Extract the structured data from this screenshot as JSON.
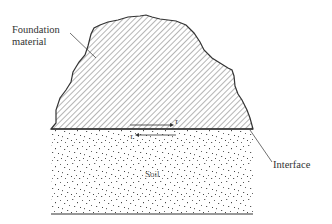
{
  "labels": {
    "foundation_line1": "Foundation",
    "foundation_line2": "material",
    "interface": "Interface",
    "soil": "Soil",
    "tau_top": "τ",
    "tau_bottom": "τ"
  },
  "colors": {
    "outline": "#333333",
    "hatch": "#777777",
    "speckle": "#555555",
    "background": "#ffffff"
  }
}
